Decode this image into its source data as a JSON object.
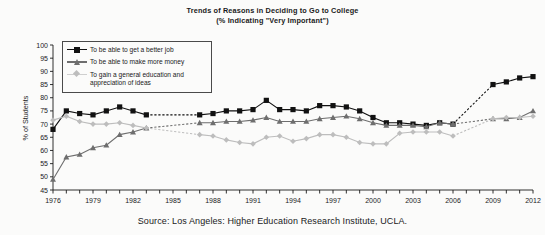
{
  "chart_data": {
    "type": "line",
    "title": "Trends of Reasons in Deciding to Go to College",
    "subtitle": "(% Indicating \"Very Important\")",
    "xlabel": "",
    "ylabel": "% of Students",
    "ylim": [
      45,
      100
    ],
    "xlim": [
      1976,
      2012
    ],
    "ytick_step": 5,
    "xtick_label_step": 3,
    "grid": false,
    "legend_position": "upper-left-inside",
    "source": "Source: Los Angeles: Higher Education Research Institute, UCLA.",
    "yticks": [
      45,
      50,
      55,
      60,
      65,
      70,
      75,
      80,
      85,
      90,
      95,
      100
    ],
    "x": [
      1976,
      1977,
      1978,
      1979,
      1980,
      1981,
      1982,
      1983,
      1984,
      1985,
      1986,
      1987,
      1988,
      1989,
      1990,
      1991,
      1992,
      1993,
      1994,
      1995,
      1996,
      1997,
      1998,
      1999,
      2000,
      2001,
      2002,
      2003,
      2004,
      2005,
      2006,
      2007,
      2008,
      2009,
      2010,
      2011,
      2012
    ],
    "xtick_labels": [
      1976,
      1979,
      1982,
      1985,
      1988,
      1991,
      1994,
      1997,
      2000,
      2003,
      2006,
      2009,
      2012
    ],
    "series": [
      {
        "name": "To be able to get a better job",
        "marker": "square",
        "color": "#111111",
        "values": [
          68.0,
          75.0,
          74.0,
          73.5,
          75.0,
          76.5,
          75.0,
          73.5,
          null,
          null,
          null,
          73.5,
          74.0,
          75.0,
          75.0,
          75.5,
          79.0,
          75.5,
          75.5,
          75.0,
          77.0,
          77.0,
          76.5,
          75.0,
          72.5,
          70.5,
          70.5,
          70.0,
          69.5,
          70.5,
          70.0,
          null,
          null,
          85.0,
          86.0,
          87.5,
          88.0
        ],
        "gap_segments": [
          [
            1983,
            1987
          ],
          [
            2006,
            2009
          ]
        ]
      },
      {
        "name": "To be able to make more money",
        "marker": "triangle",
        "color": "#6e6e6e",
        "values": [
          49.0,
          57.5,
          58.5,
          61.0,
          62.0,
          66.0,
          67.0,
          68.5,
          null,
          null,
          null,
          70.5,
          70.5,
          71.0,
          71.0,
          71.5,
          72.5,
          71.0,
          71.0,
          71.0,
          72.0,
          72.5,
          73.0,
          72.0,
          70.5,
          69.5,
          69.5,
          69.5,
          69.0,
          70.5,
          70.0,
          null,
          null,
          72.0,
          72.0,
          72.5,
          75.0
        ],
        "gap_segments": [
          [
            1983,
            1987
          ],
          [
            2006,
            2009
          ]
        ]
      },
      {
        "name": "To gain a general education and appreciation of ideas",
        "marker": "diamond",
        "color": "#bdbdbd",
        "values": [
          71.5,
          73.0,
          71.0,
          70.0,
          70.0,
          70.5,
          69.5,
          68.5,
          null,
          null,
          null,
          66.0,
          65.5,
          64.0,
          63.0,
          62.5,
          65.0,
          65.5,
          63.5,
          64.5,
          66.0,
          66.0,
          65.0,
          63.0,
          62.5,
          62.5,
          66.5,
          67.0,
          67.0,
          67.0,
          65.5,
          null,
          null,
          72.0,
          72.5,
          72.5,
          73.0
        ],
        "gap_segments": [
          [
            1983,
            1987
          ],
          [
            2006,
            2009
          ]
        ]
      }
    ]
  },
  "legend": {
    "items": [
      {
        "label": "To be able to get a better job"
      },
      {
        "label": "To be able to make more money"
      },
      {
        "label": "To gain a general education and appreciation of ideas"
      }
    ]
  }
}
